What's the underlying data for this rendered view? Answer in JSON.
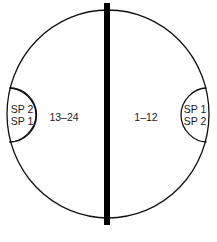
{
  "diagram": {
    "left_half": {
      "region_label": "13–24",
      "cap_lines": [
        "SP 2",
        "SP 1"
      ]
    },
    "right_half": {
      "region_label": "1–12",
      "cap_lines": [
        "SP 1",
        "SP 2"
      ]
    },
    "divider": "center-bar"
  },
  "colors": {
    "stroke": "#111111",
    "bar": "#000000",
    "background": "#ffffff"
  }
}
